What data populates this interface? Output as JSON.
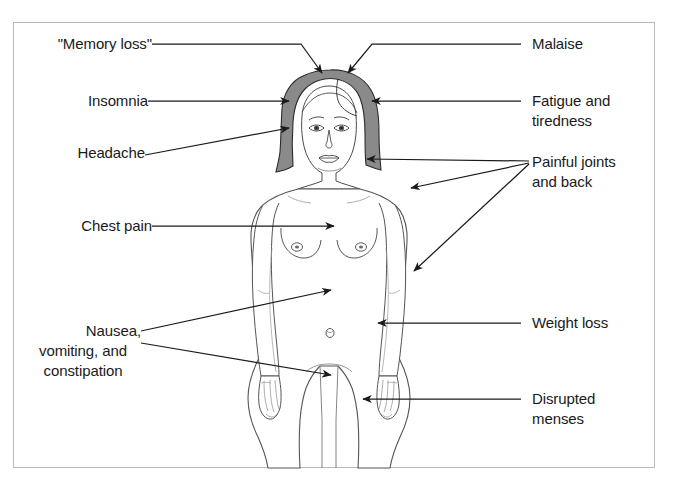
{
  "figure": {
    "border_color": "#b9b9b9",
    "line_color": "#1a1a1a",
    "text_color": "#1a1a1a",
    "background_color": "#ffffff",
    "hair_fill": "#8a8a8a",
    "body_outline": "#555555"
  },
  "labels": {
    "left": [
      {
        "id": "memory-loss",
        "text": "\"Memory loss\"",
        "lines": [
          "\"Memory loss\""
        ]
      },
      {
        "id": "insomnia",
        "text": "Insomnia",
        "lines": [
          "Insomnia"
        ]
      },
      {
        "id": "headache",
        "text": "Headache",
        "lines": [
          "Headache"
        ]
      },
      {
        "id": "chest-pain",
        "text": "Chest pain",
        "lines": [
          "Chest pain"
        ]
      },
      {
        "id": "nausea",
        "text": "Nausea, vomiting, and constipation",
        "lines": [
          "Nausea,",
          "vomiting, and",
          "constipation"
        ]
      }
    ],
    "right": [
      {
        "id": "malaise",
        "text": "Malaise",
        "lines": [
          "Malaise"
        ]
      },
      {
        "id": "fatigue",
        "text": "Fatigue and tiredness",
        "lines": [
          "Fatigue and",
          "tiredness"
        ]
      },
      {
        "id": "painful-joints",
        "text": "Painful joints and back",
        "lines": [
          "Painful joints",
          "and back"
        ]
      },
      {
        "id": "weight-loss",
        "text": "Weight loss",
        "lines": [
          "Weight loss"
        ]
      },
      {
        "id": "disrupted-menses",
        "text": "Disrupted menses",
        "lines": [
          "Disrupted",
          "menses"
        ]
      }
    ]
  },
  "text": {
    "memory_loss": "\"Memory loss\"",
    "insomnia": "Insomnia",
    "headache": "Headache",
    "chest_pain": "Chest pain",
    "nausea_l1": "Nausea,",
    "nausea_l2": "vomiting, and",
    "nausea_l3": "constipation",
    "malaise": "Malaise",
    "fatigue_l1": "Fatigue and",
    "fatigue_l2": "tiredness",
    "joints_l1": "Painful joints",
    "joints_l2": "and back",
    "weight_loss": "Weight loss",
    "menses_l1": "Disrupted",
    "menses_l2": "menses"
  }
}
